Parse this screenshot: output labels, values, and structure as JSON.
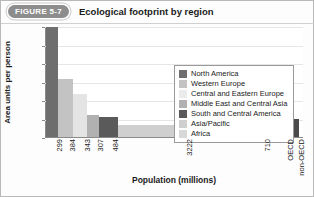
{
  "figure": {
    "badge": "FIGURE 5-7",
    "title": "Ecological footprint by region"
  },
  "chart_data": {
    "type": "bar",
    "title": "Ecological footprint by region",
    "xlabel": "Population (millions)",
    "ylabel": "Area units per person",
    "ylim": [
      0,
      12
    ],
    "yticks": [
      0,
      2,
      4,
      6,
      8,
      10,
      12
    ],
    "grid": true,
    "legend_position": "inside-top-right",
    "note": "Variable-width (Marimekko) bar chart: bar width is proportional to population in millions; bar height is ecological footprint in area units per person.",
    "categories": [
      "North America",
      "Western Europe",
      "Central and Eastern Europe",
      "Middle East and Central Asia",
      "South and Central America",
      "Asia/Pacific",
      "Africa",
      "OECD",
      "non-OECD"
    ],
    "tick_labels": [
      "299",
      "384",
      "343",
      "307",
      "484",
      "3222",
      "710",
      "OECD",
      "non-OECD"
    ],
    "populations": [
      299,
      384,
      343,
      307,
      484,
      3222,
      710,
      0,
      0
    ],
    "values": [
      11.9,
      6.3,
      4.7,
      2.4,
      2.2,
      1.3,
      1.0,
      7.0,
      1.9
    ],
    "colors": [
      "#6e6e6e",
      "#c3c3c3",
      "#e4e4e4",
      "#b1b1b1",
      "#5a5a5a",
      "#cfcfcf",
      "#d8d8d8",
      "#6e6e6e",
      "#4a4a4a"
    ],
    "bars": [
      {
        "name": "North America",
        "tick": "299",
        "value": 11.9,
        "width_pct": 4.6,
        "color": "#6e6e6e"
      },
      {
        "name": "Western Europe",
        "tick": "384",
        "value": 6.3,
        "width_pct": 5.9,
        "color": "#c3c3c3"
      },
      {
        "name": "Central and Eastern Europe",
        "tick": "343",
        "value": 4.7,
        "width_pct": 5.3,
        "color": "#e4e4e4"
      },
      {
        "name": "Middle East and Central Asia",
        "tick": "307",
        "value": 2.4,
        "width_pct": 4.7,
        "color": "#b1b1b1"
      },
      {
        "name": "South and Central America",
        "tick": "484",
        "value": 2.2,
        "width_pct": 7.4,
        "color": "#5a5a5a"
      },
      {
        "name": "Asia/Pacific",
        "tick": "3222",
        "value": 1.3,
        "width_pct": 49.5,
        "color": "#cfcfcf"
      },
      {
        "name": "Africa",
        "tick": "710",
        "value": 1.0,
        "width_pct": 10.9,
        "color": "#d8d8d8"
      },
      {
        "name": "OECD",
        "tick": "OECD",
        "value": 7.0,
        "width_pct": 4.2,
        "color": "#6e6e6e"
      },
      {
        "name": "non-OECD",
        "tick": "non-OECD",
        "value": 1.9,
        "width_pct": 4.2,
        "color": "#4a4a4a"
      }
    ],
    "legend": [
      {
        "label": "North America",
        "color": "#6e6e6e"
      },
      {
        "label": "Western Europe",
        "color": "#c3c3c3"
      },
      {
        "label": "Central and Eastern Europe",
        "color": "#ebebeb"
      },
      {
        "label": "Middle East and Central Asia",
        "color": "#b1b1b1"
      },
      {
        "label": "South and Central America",
        "color": "#5a5a5a"
      },
      {
        "label": "Asia/Pacific",
        "color": "#cfcfcf"
      },
      {
        "label": "Africa",
        "color": "#d8d8d8"
      }
    ]
  }
}
